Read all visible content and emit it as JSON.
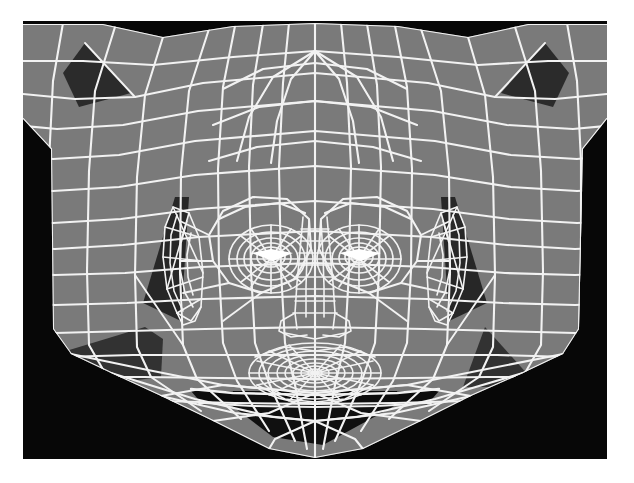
{
  "figure": {
    "caption": "",
    "type": "3d-wireframe-render",
    "render_mode": "flat-shaded surface with white wireframe edges",
    "colors": {
      "page_background": "#ffffff",
      "viewport_background": "#070707",
      "surface_light": "#7a7a7a",
      "surface_shadow": "#2e2e2e",
      "surface_dark": "#1b1b1b",
      "wireframe": "#f2f2f2",
      "frame_border": "#070707"
    },
    "geometry": {
      "viewport": {
        "x": 23,
        "y": 21,
        "width": 584,
        "height": 438
      },
      "head_outline_points": "23,26 120,26 175,38 250,27 320,24 392,27 465,38 520,26 607,26 607,120 580,150 578,330 560,355 520,372 470,395 420,420 360,448 315,457 270,448 210,420 160,395 112,372 70,355 52,330 50,150 23,120",
      "face_center_x": 315,
      "eye_left_center": {
        "x": 248,
        "y": 238
      },
      "eye_right_center": {
        "x": 382,
        "y": 238
      },
      "nose_tip": {
        "x": 315,
        "y": 300
      },
      "mouth_center": {
        "x": 315,
        "y": 352
      },
      "chin_point": {
        "x": 315,
        "y": 400
      },
      "ear_left_center": {
        "x": 163,
        "y": 245
      },
      "ear_right_center": {
        "x": 467,
        "y": 245
      }
    },
    "mesh_stats": {
      "wireframe_line_width": 2,
      "vertical_contour_count": 17,
      "horizontal_ring_count": 16,
      "eye_ring_count": 7,
      "mouth_ring_count": 9
    },
    "shadow_regions": [
      {
        "name": "upper-left-temple",
        "kind": "triangle"
      },
      {
        "name": "upper-right-temple",
        "kind": "triangle"
      },
      {
        "name": "left-ear-shadow",
        "kind": "triangle"
      },
      {
        "name": "right-ear-shadow",
        "kind": "triangle"
      },
      {
        "name": "lower-left-jaw",
        "kind": "quad"
      },
      {
        "name": "lower-right-jaw",
        "kind": "triangle"
      },
      {
        "name": "under-chin",
        "kind": "polygon"
      }
    ]
  }
}
